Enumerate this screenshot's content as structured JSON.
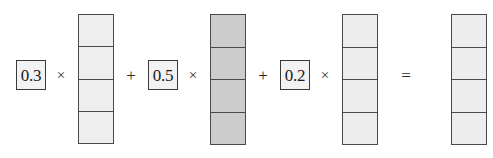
{
  "equation": {
    "description": "Linear combination of three vectors equals a result vector",
    "terms": [
      {
        "coefficient": "0.3",
        "times_symbol": "×",
        "vector": {
          "name": "vector-1",
          "fill": "#eeeeee",
          "cells": 4,
          "cell_fills": [
            "#eeeeee",
            "#eeeeee",
            "#eeeeee",
            "#eeeeee"
          ]
        }
      },
      {
        "plus_symbol": "+",
        "coefficient": "0.5",
        "times_symbol": "×",
        "vector": {
          "name": "vector-2",
          "fill": "#cccccc",
          "cells": 4,
          "cell_fills": [
            "#cccccc",
            "#cccccc",
            "#cccccc",
            "#cccccc"
          ]
        }
      },
      {
        "plus_symbol": "+",
        "coefficient": "0.2",
        "times_symbol": "×",
        "vector": {
          "name": "vector-3",
          "fill": "#ededed",
          "cells": 4,
          "cell_fills": [
            "#ededed",
            "#ededed",
            "#ededed",
            "#ededed"
          ]
        }
      }
    ],
    "equals_symbol": "=",
    "result": {
      "name": "result-vector",
      "fill": "#ededed",
      "cells": 4,
      "cell_fills": [
        "#ededed",
        "#ededed",
        "#ededed",
        "#ededed"
      ]
    }
  },
  "colors": {
    "background": "#ffffff",
    "stroke": "#4a4a4a",
    "box_stroke": "#3a3a3a",
    "box_fill": "#f2f2f2",
    "text": "#1a1a1a",
    "light_cell": "#eeeeee",
    "dark_cell": "#cccccc"
  },
  "geometry": {
    "width": 493,
    "height": 158
  }
}
